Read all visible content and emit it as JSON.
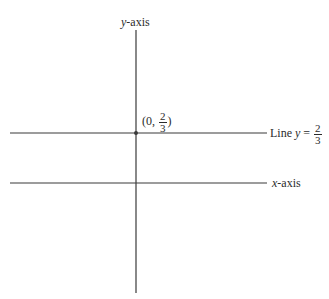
{
  "diagram": {
    "y_axis_label": {
      "var": "y",
      "text": "-axis"
    },
    "x_axis_label": {
      "var": "x",
      "text": "-axis"
    },
    "point_label": {
      "open": "(0, ",
      "num": "2",
      "den": "3",
      "close": ")"
    },
    "line_label": {
      "prefix": "Line ",
      "var": "y",
      "eq": " = ",
      "num": "2",
      "den": "3"
    },
    "colors": {
      "ink": "#2b2b2b",
      "background": "#ffffff"
    }
  }
}
